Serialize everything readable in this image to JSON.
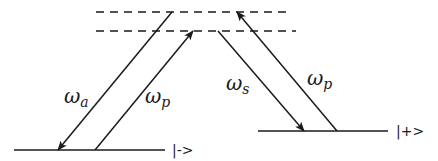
{
  "diagram": {
    "type": "energy-level diagram (Raman transitions)",
    "colors": {
      "line": "#1a1a1a",
      "background": "#ffffff"
    },
    "virtual_levels": [
      {
        "name": "upper-virtual-level",
        "style": "dashed",
        "y": 12,
        "x1": 96,
        "x2": 290
      },
      {
        "name": "lower-virtual-level",
        "style": "dashed",
        "y": 31,
        "x1": 96,
        "x2": 296
      }
    ],
    "levels": [
      {
        "name": "minus-state",
        "label": "|->",
        "y": 150,
        "x1": 14,
        "x2": 165,
        "label_x": 172
      },
      {
        "name": "plus-state",
        "label": "|+>",
        "y": 131,
        "x1": 258,
        "x2": 388,
        "label_x": 396
      }
    ],
    "transitions": [
      {
        "name": "omega-a",
        "symbol": "ω",
        "subscript": "a",
        "from": [
          172,
          12
        ],
        "to": [
          58,
          150
        ],
        "direction": "down",
        "label_pos": [
          66,
          103
        ]
      },
      {
        "name": "omega-p-left",
        "symbol": "ω",
        "subscript": "p",
        "from": [
          95,
          150
        ],
        "to": [
          193,
          31
        ],
        "direction": "up",
        "label_pos": [
          146,
          103
        ]
      },
      {
        "name": "omega-s",
        "symbol": "ω",
        "subscript": "s",
        "from": [
          218,
          31
        ],
        "to": [
          304,
          131
        ],
        "direction": "down",
        "label_pos": [
          228,
          90
        ]
      },
      {
        "name": "omega-p-right",
        "symbol": "ω",
        "subscript": "p",
        "from": [
          337,
          131
        ],
        "to": [
          237,
          12
        ],
        "direction": "up",
        "label_pos": [
          308,
          85
        ]
      }
    ]
  }
}
